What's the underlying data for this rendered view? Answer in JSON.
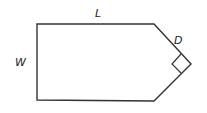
{
  "diagram": {
    "title": "",
    "shape": "pentagon (rectangle with pointed right end)",
    "labels": {
      "length": "L",
      "width": "W",
      "diagonal": "D"
    },
    "annotations": {
      "right_angle_marker": "right-angle square at the pointed vertex"
    },
    "colors": {
      "stroke": "#333333",
      "background": "#ffffff",
      "text": "#222222"
    }
  }
}
